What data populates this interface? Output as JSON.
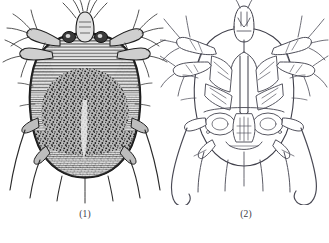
{
  "plate": {
    "background_color": "#ffffff",
    "figures": [
      {
        "id": "figure-1",
        "caption": "(1)",
        "view": "dorsal",
        "render_style": "dense-stipple-engraving",
        "ink_color": "#262626",
        "body_fill": "#8d8d8d",
        "outline_color": "#1d1d1d",
        "leg_count": 8,
        "terminal_seta_count": 6,
        "seta_style": "straight-tapered",
        "body_outline": "ovate",
        "texture": "speckled punctate cuticle with transverse striae at margins"
      },
      {
        "id": "figure-2",
        "caption": "(2)",
        "view": "ventral",
        "render_style": "fine-line-outline",
        "ink_color": "#4a4a52",
        "body_fill": "#ffffff",
        "outline_color": "#3c3c46",
        "leg_count": 8,
        "terminal_seta_count": 6,
        "seta_style": "long-sinuous-hooked",
        "body_outline": "ovate",
        "texture": "open line work showing coxal plates, epimera and genital region"
      }
    ]
  }
}
